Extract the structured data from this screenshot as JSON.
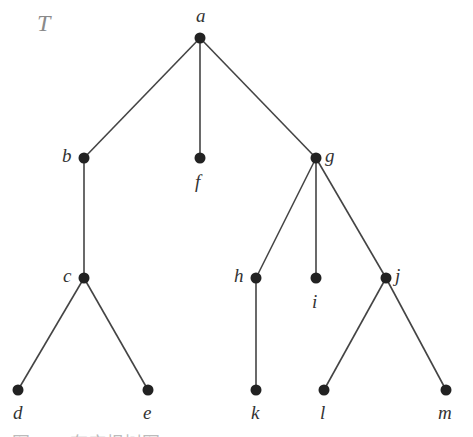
{
  "diagram": {
    "title": "T",
    "caption": "图 · · · 有序根树图 T",
    "colors": {
      "node": "#222222",
      "edge": "#444444",
      "label": "#333333",
      "title": "#8a8a8a"
    },
    "nodes": [
      {
        "id": "a",
        "label": "a",
        "x": 200,
        "y": 38,
        "lx": 196,
        "ly": 6,
        "pos": "above"
      },
      {
        "id": "b",
        "label": "b",
        "x": 84,
        "y": 158,
        "lx": 62,
        "ly": 146,
        "pos": "left"
      },
      {
        "id": "f",
        "label": "f",
        "x": 200,
        "y": 158,
        "lx": 195,
        "ly": 172,
        "pos": "below"
      },
      {
        "id": "g",
        "label": "g",
        "x": 316,
        "y": 158,
        "lx": 325,
        "ly": 146,
        "pos": "right"
      },
      {
        "id": "c",
        "label": "c",
        "x": 84,
        "y": 278,
        "lx": 63,
        "ly": 266,
        "pos": "left"
      },
      {
        "id": "h",
        "label": "h",
        "x": 256,
        "y": 278,
        "lx": 234,
        "ly": 266,
        "pos": "left"
      },
      {
        "id": "i",
        "label": "i",
        "x": 316,
        "y": 278,
        "lx": 312,
        "ly": 292,
        "pos": "below"
      },
      {
        "id": "j",
        "label": "j",
        "x": 386,
        "y": 278,
        "lx": 395,
        "ly": 266,
        "pos": "right"
      },
      {
        "id": "d",
        "label": "d",
        "x": 18,
        "y": 390,
        "lx": 13,
        "ly": 403,
        "pos": "below"
      },
      {
        "id": "e",
        "label": "e",
        "x": 148,
        "y": 390,
        "lx": 143,
        "ly": 403,
        "pos": "below"
      },
      {
        "id": "k",
        "label": "k",
        "x": 256,
        "y": 390,
        "lx": 251,
        "ly": 403,
        "pos": "below"
      },
      {
        "id": "l",
        "label": "l",
        "x": 324,
        "y": 390,
        "lx": 320,
        "ly": 403,
        "pos": "below"
      },
      {
        "id": "m",
        "label": "m",
        "x": 446,
        "y": 390,
        "lx": 438,
        "ly": 403,
        "pos": "below"
      }
    ],
    "edges": [
      [
        "a",
        "b"
      ],
      [
        "a",
        "f"
      ],
      [
        "a",
        "g"
      ],
      [
        "b",
        "c"
      ],
      [
        "c",
        "d"
      ],
      [
        "c",
        "e"
      ],
      [
        "g",
        "h"
      ],
      [
        "g",
        "i"
      ],
      [
        "g",
        "j"
      ],
      [
        "h",
        "k"
      ],
      [
        "j",
        "l"
      ],
      [
        "j",
        "m"
      ]
    ]
  }
}
